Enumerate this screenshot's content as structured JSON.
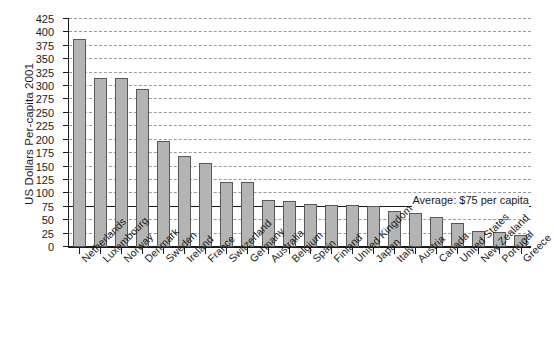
{
  "chart_data": {
    "type": "bar",
    "title": "",
    "xlabel": "",
    "ylabel": "US Dollars Per-capita 2001",
    "ylim": [
      0,
      425
    ],
    "ytick_step": 25,
    "grid": true,
    "legend": null,
    "categories": [
      "Netherlands",
      "Luxembourg",
      "Norway",
      "Denmark",
      "Sweden",
      "Ireland",
      "France",
      "Switzerland",
      "Germany",
      "Australia",
      "Belgium",
      "Spain",
      "Finland",
      "United Kingdom",
      "Japan",
      "Italy",
      "Austria",
      "Canada",
      "United States",
      "New Zealand",
      "Portugal",
      "Greece"
    ],
    "values": [
      388,
      315,
      315,
      294,
      198,
      170,
      157,
      122,
      121,
      88,
      86,
      81,
      79,
      78,
      77,
      68,
      64,
      56,
      44,
      29,
      28,
      22
    ],
    "ytick_labels": [
      "0",
      "25",
      "50",
      "75",
      "100",
      "125",
      "150",
      "175",
      "200",
      "225",
      "250",
      "275",
      "300",
      "325",
      "350",
      "375",
      "400",
      "425"
    ],
    "annotations": [
      {
        "text": "Average: $75 per capita",
        "value": 75,
        "style": "horizontal-reference-line"
      }
    ],
    "colors": {
      "bar_fill": "#b4b4b4",
      "bar_edge": "#585858",
      "axis": "#1a1a1a",
      "gridline": "#9a9a9a",
      "background": "#ffffff"
    }
  }
}
